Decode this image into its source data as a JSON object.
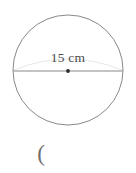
{
  "figure": {
    "type": "circle-diameter-diagram",
    "background_color": "#ffffff",
    "circle": {
      "center_x": 68,
      "center_y": 70,
      "radius": 55,
      "stroke_color": "#7a7a7a",
      "stroke_width": 0.9,
      "fill": "none"
    },
    "diameter_line": {
      "x1": 13,
      "y1": 71,
      "x2": 123,
      "y2": 71,
      "stroke_color": "#8a8a8a",
      "stroke_width": 1.1
    },
    "faint_arc": {
      "start_x": 14,
      "start_y": 70,
      "end_x": 122,
      "end_y": 70,
      "peak_y": 56,
      "stroke_color": "#e2e2e2",
      "stroke_width": 0.9
    },
    "center_dot": {
      "cx": 68,
      "cy": 71,
      "r": 1.9,
      "fill_color": "#2a2a2a"
    },
    "label": {
      "text": "15 cm",
      "value": "15",
      "unit": "cm",
      "color": "#4a4a4a",
      "center_x": 66,
      "center_y": 58
    },
    "trailing_text": {
      "text": "(",
      "color": "#6f6f6f",
      "x": 40,
      "y": 154
    }
  }
}
